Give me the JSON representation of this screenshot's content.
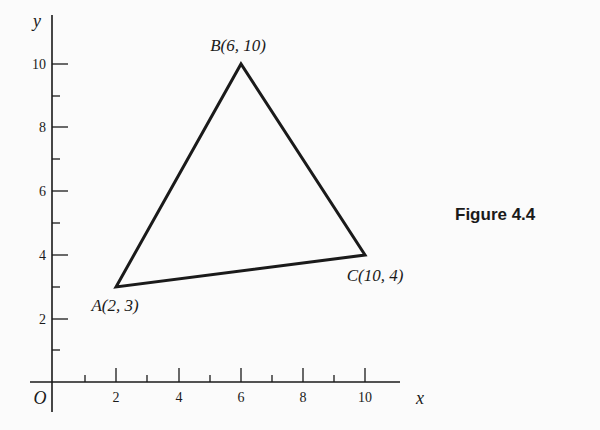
{
  "figure": {
    "caption": "Figure 4.4",
    "axes": {
      "x_label": "x",
      "y_label": "y",
      "origin_label": "O",
      "x_ticks": [
        "2",
        "4",
        "6",
        "8",
        "10"
      ],
      "y_ticks": [
        "2",
        "4",
        "6",
        "8",
        "10"
      ]
    },
    "points": [
      {
        "name": "A",
        "label": "A(2, 3)",
        "x": 2,
        "y": 3
      },
      {
        "name": "B",
        "label": "B(6, 10)",
        "x": 6,
        "y": 10
      },
      {
        "name": "C",
        "label": "C(10, 4)",
        "x": 10,
        "y": 4
      }
    ],
    "colors": {
      "stroke": "#1a1a1a",
      "background": "#fbfbfb"
    }
  }
}
